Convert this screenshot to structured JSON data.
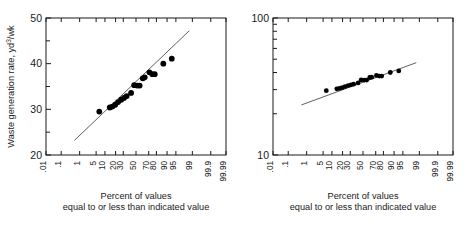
{
  "figure": {
    "background": "#ffffff",
    "ink": "#1a1a1a",
    "marker_color": "#000000",
    "line_color": "#4d4d4d"
  },
  "chart_data": [
    {
      "type": "scatter",
      "id": "left-probability-plot",
      "title": "",
      "xlabel_line1": "Percent of values",
      "xlabel_line2": "equal to or less than indicated value",
      "ylabel_main": "Waste generation rate, yd",
      "ylabel_sup": "3",
      "ylabel_tail": "/wk",
      "ylabel_full": "Waste generation rate, yd3/wk",
      "x_scale": "probability",
      "y_scale": "linear",
      "xlim": [
        0.01,
        99.99
      ],
      "ylim": [
        20,
        50
      ],
      "grid": false,
      "legend": "none",
      "xticks": [
        ".01",
        ".1",
        "1",
        "5",
        "10",
        "20",
        "30",
        "50",
        "70",
        "80",
        "90",
        "95",
        "99",
        "99.9",
        "99.99"
      ],
      "xtick_values": [
        0.01,
        0.1,
        1,
        5,
        10,
        20,
        30,
        50,
        70,
        80,
        90,
        95,
        99,
        99.9,
        99.99
      ],
      "xtick_labeled": [
        true,
        true,
        true,
        true,
        true,
        true,
        true,
        true,
        true,
        true,
        true,
        true,
        true,
        true,
        true
      ],
      "yticks": [
        20,
        30,
        40,
        50
      ],
      "ytick_minor": [
        25,
        35,
        45
      ],
      "points": [
        {
          "x": 6.5,
          "y": 29.5
        },
        {
          "x": 14.0,
          "y": 30.4
        },
        {
          "x": 16.5,
          "y": 30.6
        },
        {
          "x": 19.5,
          "y": 31.0
        },
        {
          "x": 23.0,
          "y": 31.6
        },
        {
          "x": 27.0,
          "y": 32.1
        },
        {
          "x": 31.0,
          "y": 32.5
        },
        {
          "x": 35.0,
          "y": 32.9
        },
        {
          "x": 42.0,
          "y": 33.6
        },
        {
          "x": 47.0,
          "y": 35.3
        },
        {
          "x": 52.0,
          "y": 35.2
        },
        {
          "x": 56.0,
          "y": 35.2
        },
        {
          "x": 61.0,
          "y": 36.8
        },
        {
          "x": 64.0,
          "y": 37.0
        },
        {
          "x": 71.0,
          "y": 38.1
        },
        {
          "x": 75.0,
          "y": 37.7
        },
        {
          "x": 78.0,
          "y": 37.7
        },
        {
          "x": 87.0,
          "y": 40.0
        },
        {
          "x": 93.0,
          "y": 41.1
        }
      ],
      "fit_line": {
        "x1": 0.55,
        "y1": 23.2,
        "x2": 98.6,
        "y2": 47.2
      }
    },
    {
      "type": "scatter",
      "id": "right-probability-plot",
      "title": "",
      "xlabel_line1": "Percent of values",
      "xlabel_line2": "equal to or less than indicated value",
      "ylabel_full": "",
      "x_scale": "probability",
      "y_scale": "log",
      "xlim": [
        0.01,
        99.99
      ],
      "ylim": [
        10,
        100
      ],
      "grid": false,
      "legend": "none",
      "xticks": [
        ".01",
        ".1",
        "1",
        "5",
        "10",
        "20",
        "30",
        "50",
        "70",
        "80",
        "90",
        "95",
        "99",
        "99.9",
        "99.99"
      ],
      "xtick_values": [
        0.01,
        0.1,
        1,
        5,
        10,
        20,
        30,
        50,
        70,
        80,
        90,
        95,
        99,
        99.9,
        99.99
      ],
      "yticks": [
        10,
        100
      ],
      "ytick_minor": [
        20,
        30,
        40,
        50,
        60,
        70,
        80,
        90
      ],
      "points": [
        {
          "x": 6.5,
          "y": 29.5
        },
        {
          "x": 14.0,
          "y": 30.4
        },
        {
          "x": 16.5,
          "y": 30.6
        },
        {
          "x": 19.5,
          "y": 31.0
        },
        {
          "x": 23.0,
          "y": 31.6
        },
        {
          "x": 27.0,
          "y": 32.1
        },
        {
          "x": 31.0,
          "y": 32.5
        },
        {
          "x": 35.0,
          "y": 32.9
        },
        {
          "x": 42.0,
          "y": 33.6
        },
        {
          "x": 47.0,
          "y": 35.3
        },
        {
          "x": 52.0,
          "y": 35.2
        },
        {
          "x": 56.0,
          "y": 35.2
        },
        {
          "x": 61.0,
          "y": 36.8
        },
        {
          "x": 64.0,
          "y": 37.0
        },
        {
          "x": 71.0,
          "y": 38.1
        },
        {
          "x": 75.0,
          "y": 37.7
        },
        {
          "x": 78.0,
          "y": 37.7
        },
        {
          "x": 87.0,
          "y": 40.0
        },
        {
          "x": 93.0,
          "y": 41.1
        }
      ],
      "fit_line": {
        "x1": 0.55,
        "y1": 23.2,
        "x2": 98.6,
        "y2": 47.2
      }
    }
  ]
}
